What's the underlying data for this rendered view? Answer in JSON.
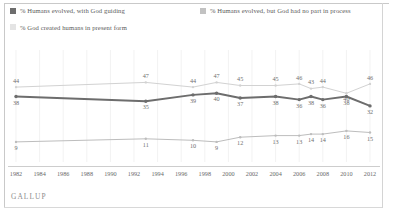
{
  "legend": {
    "items": [
      {
        "label": "% Humans evolved, with God guiding",
        "color": "#6d6d6d",
        "marker": "legend-swatch-dark"
      },
      {
        "label": "% Humans evolved, but God had no part in process",
        "color": "#c2c2c2",
        "marker": "legend-swatch-mid"
      },
      {
        "label": "% God created humans in present form",
        "color": "#e4e4e4",
        "marker": "legend-swatch-light"
      }
    ]
  },
  "footer": {
    "source": "GALLUP"
  },
  "chart_data": {
    "type": "line",
    "title": "",
    "subtitle": "",
    "xlabel": "",
    "ylabel": "",
    "grid": true,
    "legend_position": "top",
    "ylim": [
      0,
      60
    ],
    "xlim": [
      1982,
      2012
    ],
    "x": [
      1982,
      1993,
      1997,
      1999,
      2001,
      2004,
      2006,
      2007,
      2008,
      2010,
      2012
    ],
    "axis_tick_labels": [
      "1982",
      "1984",
      "1986",
      "1988",
      "1990",
      "1992",
      "1994",
      "1996",
      "1998",
      "2000",
      "2002",
      "2004",
      "2006",
      "2008",
      "2010",
      "2012"
    ],
    "axis_tick_years": [
      1982,
      1984,
      1986,
      1988,
      1990,
      1992,
      1994,
      1996,
      1998,
      2000,
      2002,
      2004,
      2006,
      2008,
      2010,
      2012
    ],
    "series": [
      {
        "name": "% God created humans in present form",
        "color": "#d2d2d2",
        "values": [
          44,
          47,
          44,
          47,
          45,
          45,
          46,
          43,
          44,
          40,
          46
        ],
        "label_positions": [
          "above",
          "above",
          "above",
          "above",
          "above",
          "above",
          "above",
          "above",
          "above",
          "below",
          "above"
        ]
      },
      {
        "name": "% Humans evolved, with God guiding",
        "color": "#6d6d6d",
        "values": [
          38,
          35,
          39,
          40,
          37,
          38,
          36,
          38,
          36,
          38,
          32
        ],
        "label_positions": [
          "below",
          "below",
          "below",
          "below",
          "below",
          "below",
          "below",
          "below",
          "below",
          "below",
          "below"
        ]
      },
      {
        "name": "% Humans evolved, but God had no part in process",
        "color": "#bdbdbd",
        "values": [
          9,
          11,
          10,
          9,
          12,
          13,
          13,
          14,
          14,
          16,
          15
        ],
        "label_positions": [
          "below",
          "below",
          "below",
          "below",
          "below",
          "below",
          "below",
          "below",
          "below",
          "below",
          "below"
        ]
      }
    ]
  }
}
